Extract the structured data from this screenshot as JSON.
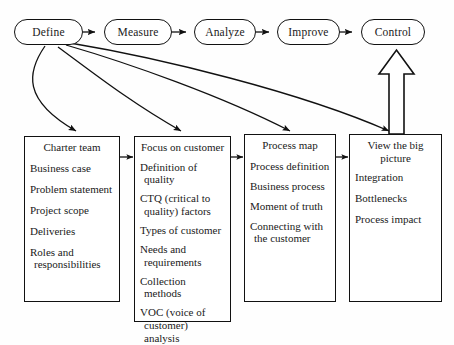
{
  "diagram": {
    "ink_color": "#111111",
    "paper_color": "#fefefe"
  },
  "phases": [
    {
      "id": "define",
      "label": "Define"
    },
    {
      "id": "measure",
      "label": "Measure"
    },
    {
      "id": "analyze",
      "label": "Analyze"
    },
    {
      "id": "improve",
      "label": "Improve"
    },
    {
      "id": "control",
      "label": "Control"
    }
  ],
  "boxes": [
    {
      "id": "charter",
      "title": "Charter team",
      "items": [
        "Business case",
        "Problem statement",
        "Project scope",
        "Deliveries",
        "Roles and responsibilities"
      ]
    },
    {
      "id": "focus",
      "title": "Focus on customer",
      "items": [
        "Definition of quality",
        "CTQ (critical to quality) factors",
        "Types of customer",
        "Needs and requirements",
        "Collection methods",
        "VOC (voice of customer)  analysis"
      ]
    },
    {
      "id": "process",
      "title": "Process map",
      "items": [
        "Process definition",
        "Business process",
        "Moment of truth",
        "Connecting with the customer"
      ]
    },
    {
      "id": "bigpic",
      "title": "View the big picture",
      "items": [
        "Integration",
        "Bottlenecks",
        "Process impact"
      ]
    }
  ],
  "connectors": {
    "phase_chain": "Define → Measure → Analyze → Improve → Control",
    "fan_out_from": "Define",
    "box_chain": "Charter team → Focus on customer → Process map → View the big picture",
    "feedback": "View the big picture → Control"
  }
}
